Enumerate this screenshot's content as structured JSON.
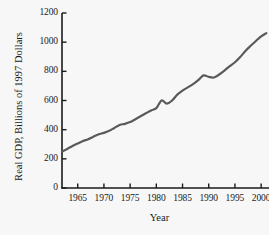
{
  "chart_data": {
    "type": "line",
    "title": "",
    "xlabel": "Year",
    "ylabel": "Real GDP, Billions of 1997 Dollars",
    "xlim": [
      1962,
      2001.5
    ],
    "ylim": [
      0,
      1200
    ],
    "xticks": [
      1965,
      1970,
      1975,
      1980,
      1985,
      1990,
      1995,
      2000
    ],
    "xtick_labels": [
      "1965",
      "1970",
      "1975",
      "1980",
      "1985",
      "1990",
      "1995",
      "2000"
    ],
    "yticks": [
      0,
      200,
      400,
      600,
      800,
      1000,
      1200
    ],
    "ytick_labels": [
      "0",
      "200",
      "400",
      "600",
      "800",
      "1000",
      "1200"
    ],
    "grid": false,
    "legend": null,
    "line_color": "#5a5a5a",
    "line_width": 2.2,
    "series": [
      {
        "name": "Real GDP",
        "x": [
          1962,
          1963,
          1964,
          1965,
          1966,
          1967,
          1968,
          1969,
          1970,
          1971,
          1972,
          1973,
          1974,
          1975,
          1976,
          1977,
          1978,
          1979,
          1980,
          1981,
          1982,
          1983,
          1984,
          1985,
          1986,
          1987,
          1988,
          1989,
          1990,
          1991,
          1992,
          1993,
          1994,
          1995,
          1996,
          1997,
          1998,
          1999,
          2000,
          2001
        ],
        "values": [
          250,
          268,
          288,
          305,
          322,
          335,
          352,
          368,
          378,
          392,
          412,
          432,
          440,
          452,
          472,
          492,
          512,
          532,
          548,
          600,
          578,
          600,
          640,
          668,
          690,
          712,
          740,
          772,
          762,
          758,
          778,
          805,
          835,
          862,
          898,
          940,
          975,
          1008,
          1040,
          1062
        ]
      }
    ]
  },
  "axis": {
    "ylabel_text": "Real GDP, Billions of 1997 Dollars",
    "xlabel_text": "Year"
  }
}
